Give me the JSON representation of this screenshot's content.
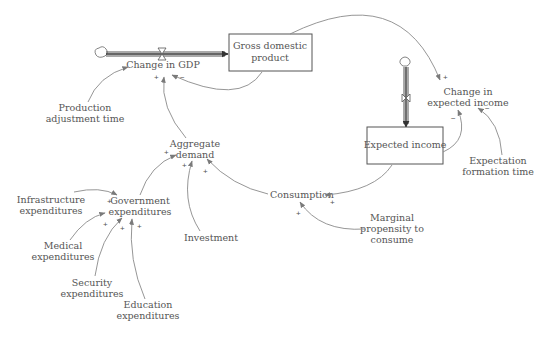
{
  "diagram": {
    "type": "stock-and-flow",
    "stocks": {
      "gdp": {
        "line1": "Gross domestic",
        "line2": "product"
      },
      "expected_income": {
        "line1": "Expected income"
      }
    },
    "flows": {
      "change_in_gdp": {
        "label": "Change in GDP"
      },
      "change_in_expected_income": {
        "line1": "Change in",
        "line2": "expected income"
      }
    },
    "variables": {
      "production_adjustment_time": {
        "line1": "Production",
        "line2": "adjustment time"
      },
      "aggregate_demand": {
        "line1": "Aggregate",
        "line2": "demand"
      },
      "government_expenditures": {
        "line1": "Government",
        "line2": "expenditures"
      },
      "infrastructure_expenditures": {
        "line1": "Infrastructure",
        "line2": "expenditures"
      },
      "medical_expenditures": {
        "line1": "Medical",
        "line2": "expenditures"
      },
      "security_expenditures": {
        "line1": "Security",
        "line2": "expenditures"
      },
      "education_expenditures": {
        "line1": "Education",
        "line2": "expenditures"
      },
      "investment": {
        "label": "Investment"
      },
      "consumption": {
        "label": "Consumption"
      },
      "marginal_propensity": {
        "line1": "Marginal",
        "line2": "propensity to",
        "line3": "consume"
      },
      "expectation_formation_time": {
        "line1": "Expectation",
        "line2": "formation time"
      }
    },
    "polarities": {
      "adj_time_to_change_gdp": "+",
      "agg_demand_to_change_gdp": "+",
      "gdp_to_change_gdp": "−",
      "gdp_to_change_expected_income": "+",
      "expected_income_to_change_expected_income": "−",
      "formation_time_to_change_expected_income": "−",
      "expected_income_to_consumption": "+",
      "mpc_to_consumption": "+",
      "gov_to_agg_demand": "+",
      "investment_to_agg_demand": "+",
      "consumption_to_agg_demand": "+",
      "infrastructure_to_gov": "+",
      "medical_to_gov": "+",
      "security_to_gov": "+",
      "education_to_gov": "+"
    },
    "colors": {
      "text": "#555555",
      "link": "#8a8a8a",
      "stock_border": "#555555",
      "background": "#ffffff"
    }
  }
}
